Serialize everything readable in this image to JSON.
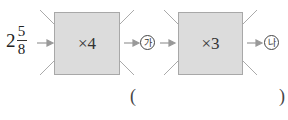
{
  "problem": {
    "start_value": {
      "whole": "2",
      "numerator": "5",
      "denominator": "8"
    },
    "machines": [
      {
        "label": "×4"
      },
      {
        "label": "×3"
      }
    ],
    "intermediate_label": "가",
    "result_label": "나",
    "answer": {
      "open_paren": "(",
      "close_paren": ")",
      "value": ""
    }
  },
  "colors": {
    "box_fill": "#dcdcdc",
    "box_border": "#a8a8a8",
    "arrow": "#999999"
  }
}
